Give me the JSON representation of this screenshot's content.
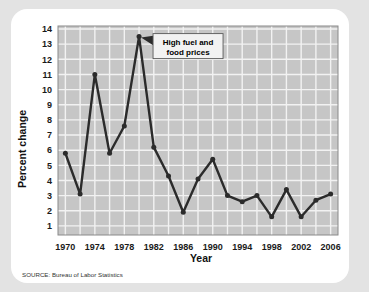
{
  "card": {
    "source_note": "SOURCE: Bureau of Labor Statistics"
  },
  "colors": {
    "page_background": "#e3e3e3",
    "card_background": "#ffffff",
    "plot_background": "#c6c6c6",
    "gridline": "#f2f2f2",
    "plot_border": "#8a8a8a",
    "line": "#2b2b2b",
    "marker": "#2b2b2b",
    "text": "#1a1a1a",
    "annotation_background": "#f2f2f2",
    "annotation_border": "#5a5a5a"
  },
  "annotation": {
    "line1": "High fuel and",
    "line2": "food prices",
    "target_year": 1980,
    "target_value": 13.5
  },
  "chart_data": {
    "type": "line",
    "title": "",
    "subtitle": "",
    "xlabel": "Year",
    "ylabel": "Percent change",
    "xlim": [
      1969,
      2007
    ],
    "ylim": [
      0.4,
      14.2
    ],
    "yticks": [
      1,
      2,
      3,
      4,
      5,
      6,
      7,
      8,
      9,
      10,
      11,
      12,
      13,
      14
    ],
    "xticks": [
      1970,
      1974,
      1978,
      1982,
      1986,
      1990,
      1994,
      1998,
      2002,
      2006
    ],
    "xtick_labels": [
      "1970",
      "1974",
      "1978",
      "1982",
      "1986",
      "1990",
      "1994",
      "1998",
      "2002",
      "2006"
    ],
    "ytick_labels": [
      "1",
      "2",
      "3",
      "4",
      "5",
      "6",
      "7",
      "8",
      "9",
      "10",
      "11",
      "12",
      "13",
      "14"
    ],
    "grid": true,
    "grid_x_step": 2,
    "grid_y_step": 1,
    "legend": false,
    "legend_position": "none",
    "markers": true,
    "x": [
      1970,
      1972,
      1974,
      1976,
      1978,
      1980,
      1982,
      1984,
      1986,
      1988,
      1990,
      1992,
      1994,
      1996,
      1998,
      2000,
      2002,
      2004,
      2006
    ],
    "values": [
      5.8,
      3.1,
      11.0,
      5.8,
      7.6,
      13.5,
      6.2,
      4.3,
      1.9,
      4.1,
      5.4,
      3.0,
      2.6,
      3.0,
      1.6,
      3.4,
      1.6,
      2.7,
      3.1
    ],
    "series": [
      {
        "name": "Percent change",
        "values": [
          5.8,
          3.1,
          11.0,
          5.8,
          7.6,
          13.5,
          6.2,
          4.3,
          1.9,
          4.1,
          5.4,
          3.0,
          2.6,
          3.0,
          1.6,
          3.4,
          1.6,
          2.7,
          3.1
        ]
      }
    ],
    "annotations": [
      {
        "text": "High fuel and food prices",
        "x": 1980,
        "y": 13.5
      }
    ]
  }
}
